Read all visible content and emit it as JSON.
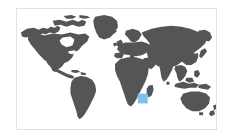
{
  "widget": {
    "type": "world-map-thumbnail",
    "title": "World map",
    "alt_text": "World map with highlighted region in the Indian Ocean",
    "width": 234,
    "height": 139
  },
  "colors": {
    "background": "#ffffff",
    "ocean": "#ffffff",
    "land": "#555557",
    "highlight": "#7fc0ea",
    "frame_border": "#e2e2e2"
  },
  "frame": {
    "x": 16,
    "y": 8,
    "width": 201,
    "height": 122,
    "border_width": 1
  },
  "highlight": {
    "label": "Indian Ocean region",
    "x": 138,
    "y": 94,
    "width": 10,
    "height": 10,
    "color": "#7fc0ea"
  },
  "landmasses": [
    {
      "name": "north-america"
    },
    {
      "name": "south-america"
    },
    {
      "name": "greenland"
    },
    {
      "name": "europe"
    },
    {
      "name": "africa"
    },
    {
      "name": "asia"
    },
    {
      "name": "australia"
    },
    {
      "name": "new-zealand"
    },
    {
      "name": "madagascar"
    },
    {
      "name": "japan"
    },
    {
      "name": "indonesia"
    },
    {
      "name": "british-isles"
    },
    {
      "name": "iceland"
    },
    {
      "name": "caribbean"
    }
  ]
}
